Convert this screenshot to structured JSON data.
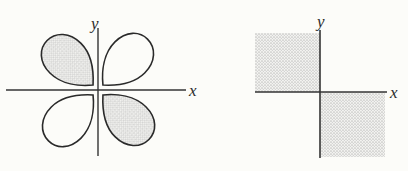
{
  "page": {
    "background": "#fcfcf9"
  },
  "colors": {
    "line": "#343434",
    "curve": "#2a2a2a",
    "label": "#2b2b2b",
    "shade_average": "#dcdcdc",
    "shade_dot": "#c3c3c3",
    "shade_dot2": "#d2d2d2",
    "shade_bg": "#f3f3f0"
  },
  "figures": {
    "rose": {
      "x_label": "x",
      "y_label": "y",
      "petals": [
        {
          "position": "upper-left",
          "shaded": true
        },
        {
          "position": "upper-right",
          "shaded": false
        },
        {
          "position": "lower-left",
          "shaded": false
        },
        {
          "position": "lower-right",
          "shaded": true
        }
      ]
    },
    "squares": {
      "x_label": "x",
      "y_label": "y",
      "shaded_regions": [
        "second-quadrant-square",
        "fourth-quadrant-square"
      ]
    }
  }
}
